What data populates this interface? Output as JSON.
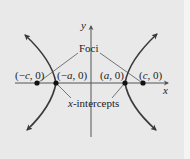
{
  "diagram": {
    "type": "hyperbola",
    "orientation": "horizontal transverse axis",
    "axes": {
      "x_label": "x",
      "y_label": "y"
    },
    "callouts": {
      "foci_label": "Foci",
      "intercepts_label_var": "x",
      "intercepts_label_rest": "-intercepts"
    },
    "points": [
      {
        "id": "neg-c",
        "label_open": "(−",
        "label_var": "c",
        "label_close": ", 0)",
        "role": "focus"
      },
      {
        "id": "neg-a",
        "label_open": "(−",
        "label_var": "a",
        "label_close": ", 0)",
        "role": "vertex"
      },
      {
        "id": "pos-a",
        "label_open": "(",
        "label_var": "a",
        "label_close": ", 0)",
        "role": "vertex"
      },
      {
        "id": "pos-c",
        "label_open": "(",
        "label_var": "c",
        "label_close": ", 0)",
        "role": "focus"
      }
    ],
    "colors": {
      "background": "#e9e9e9",
      "curve": "#3a3a3a",
      "axes": "#555555",
      "leader_lines": "#555555",
      "points": "#111111"
    }
  }
}
